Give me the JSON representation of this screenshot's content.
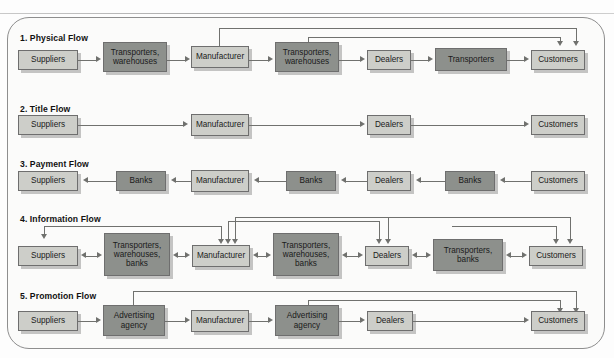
{
  "figure": {
    "shape": "rounded-rectangle-panel",
    "background_color": "#fbfbfa",
    "border_color": "#8e8e8e",
    "box_light_color": "#cdcec9",
    "box_dark_color": "#8d908c",
    "connector_color": "#70716e"
  },
  "sections": [
    {
      "id": "physical-flow",
      "title": "1. Physical Flow",
      "nodes": [
        {
          "label": "Suppliers",
          "tone": "light"
        },
        {
          "label": "Transporters,\nwarehouses",
          "tone": "dark"
        },
        {
          "label": "Manufacturer",
          "tone": "light"
        },
        {
          "label": "Transporters,\nwarehouses",
          "tone": "dark"
        },
        {
          "label": "Dealers",
          "tone": "light"
        },
        {
          "label": "Transporters",
          "tone": "dark"
        },
        {
          "label": "Customers",
          "tone": "light"
        }
      ],
      "flow_direction": "left-to-right",
      "arrow_style": "single",
      "return_paths": 2,
      "return_from": [
        "Manufacturer",
        "Transporters, warehouses"
      ],
      "return_to": "Customers"
    },
    {
      "id": "title-flow",
      "title": "2. Title Flow",
      "nodes": [
        {
          "label": "Suppliers",
          "tone": "light"
        },
        {
          "label": "Manufacturer",
          "tone": "light"
        },
        {
          "label": "Dealers",
          "tone": "light"
        },
        {
          "label": "Customers",
          "tone": "light"
        }
      ],
      "flow_direction": "left-to-right",
      "arrow_style": "single",
      "return_paths": 0
    },
    {
      "id": "payment-flow",
      "title": "3. Payment Flow",
      "nodes": [
        {
          "label": "Suppliers",
          "tone": "light"
        },
        {
          "label": "Banks",
          "tone": "dark"
        },
        {
          "label": "Manufacturer",
          "tone": "light"
        },
        {
          "label": "Banks",
          "tone": "dark"
        },
        {
          "label": "Dealers",
          "tone": "light"
        },
        {
          "label": "Banks",
          "tone": "dark"
        },
        {
          "label": "Customers",
          "tone": "light"
        }
      ],
      "flow_direction": "right-to-left",
      "arrow_style": "single",
      "return_paths": 0
    },
    {
      "id": "information-flow",
      "title": "4. Information Flow",
      "nodes": [
        {
          "label": "Suppliers",
          "tone": "light"
        },
        {
          "label": "Transporters,\nwarehouses,\nbanks",
          "tone": "dark"
        },
        {
          "label": "Manufacturer",
          "tone": "light"
        },
        {
          "label": "Transporters,\nwarehouses,\nbanks",
          "tone": "dark"
        },
        {
          "label": "Dealers",
          "tone": "light"
        },
        {
          "label": "Transporters,\nbanks",
          "tone": "dark"
        },
        {
          "label": "Customers",
          "tone": "light"
        }
      ],
      "flow_direction": "bidirectional",
      "arrow_style": "double",
      "return_paths": 4,
      "feedback_arrow_counts": {
        "Suppliers": 1,
        "Manufacturer": 3,
        "Dealers": 2,
        "Customers": 2
      }
    },
    {
      "id": "promotion-flow",
      "title": "5. Promotion Flow",
      "nodes": [
        {
          "label": "Suppliers",
          "tone": "light"
        },
        {
          "label": "Advertising\nagency",
          "tone": "dark"
        },
        {
          "label": "Manufacturer",
          "tone": "light"
        },
        {
          "label": "Advertising\nagency",
          "tone": "dark"
        },
        {
          "label": "Dealers",
          "tone": "light"
        },
        {
          "label": "Customers",
          "tone": "light"
        }
      ],
      "flow_direction": "left-to-right",
      "arrow_style": "single",
      "return_paths": 2,
      "return_from": [
        "Advertising agency",
        "Advertising agency"
      ],
      "return_to": "Customers"
    }
  ]
}
